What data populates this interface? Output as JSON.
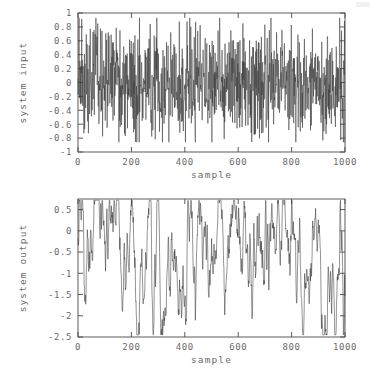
{
  "figure": {
    "background": "#ffffff",
    "line_color": "#3a3a3a",
    "axis_color": "#4a4a4a",
    "text_color": "#6b6b6b"
  },
  "chart_data": [
    {
      "type": "line",
      "name": "system-input",
      "title": "",
      "xlabel": "sample",
      "ylabel": "system input",
      "xlim": [
        0,
        1000
      ],
      "ylim": [
        -1,
        1
      ],
      "xticks": [
        0,
        200,
        400,
        600,
        800,
        1000
      ],
      "xticklabels": [
        "0",
        "200",
        "400",
        "600",
        "800",
        "1000"
      ],
      "yticks": [
        -1,
        -0.8,
        -0.6,
        -0.4,
        -0.2,
        0,
        0.2,
        0.4,
        0.6,
        0.8,
        1
      ],
      "yticklabels": [
        "-1",
        "-0.8",
        "-0.6",
        "-0.4",
        "-0.2",
        "0",
        "0.2",
        "0.4",
        "0.6",
        "0.8",
        "1"
      ],
      "grid": false,
      "legend": null,
      "n_points": 1000,
      "signal": {
        "kind": "white-noise",
        "seed": 20241,
        "amplitude": 0.4,
        "clip": [
          -0.86,
          0.93
        ],
        "mean": 0.0
      },
      "series": [
        {
          "name": "system input",
          "description": "pseudo-random excitation signal, zero mean, spans roughly -0.85 to +0.92"
        }
      ]
    },
    {
      "type": "line",
      "name": "system-output",
      "title": "",
      "xlabel": "sample",
      "ylabel": "system output",
      "xlim": [
        0,
        1000
      ],
      "ylim": [
        -2.5,
        0.75
      ],
      "xticks": [
        0,
        200,
        400,
        600,
        800,
        1000
      ],
      "xticklabels": [
        "0",
        "200",
        "400",
        "600",
        "800",
        "1000"
      ],
      "yticks": [
        -2.5,
        -2,
        -1.5,
        -1,
        -0.5,
        0,
        0.5
      ],
      "yticklabels": [
        "-2.5",
        "-2",
        "-1.5",
        "-1",
        "-0.5",
        "0",
        "0.5"
      ],
      "grid": false,
      "legend": null,
      "n_points": 1000,
      "signal": {
        "kind": "filtered-noise",
        "seed": 20241,
        "smoothing": 0.86,
        "gain": 2.1,
        "offset": -0.3,
        "drift_amplitude": 0.55,
        "clip": [
          -2.45,
          0.72
        ]
      },
      "series": [
        {
          "name": "system output",
          "description": "low-pass filtered response with slow drift; deep troughs near samples 35, 325, 560, 745, 830"
        }
      ],
      "annotations": [
        {
          "sample": 35,
          "value": -2.2,
          "note": "trough"
        },
        {
          "sample": 325,
          "value": -2.45,
          "note": "deepest trough"
        },
        {
          "sample": 220,
          "value": 0.72,
          "note": "peak"
        },
        {
          "sample": 390,
          "value": 0.6,
          "note": "peak"
        },
        {
          "sample": 745,
          "value": -2.15,
          "note": "trough"
        }
      ]
    }
  ],
  "layout": {
    "input_plot": {
      "left": 78,
      "top": 13,
      "width": 267,
      "height": 139
    },
    "output_plot": {
      "left": 78,
      "top": 199,
      "width": 267,
      "height": 138
    }
  }
}
